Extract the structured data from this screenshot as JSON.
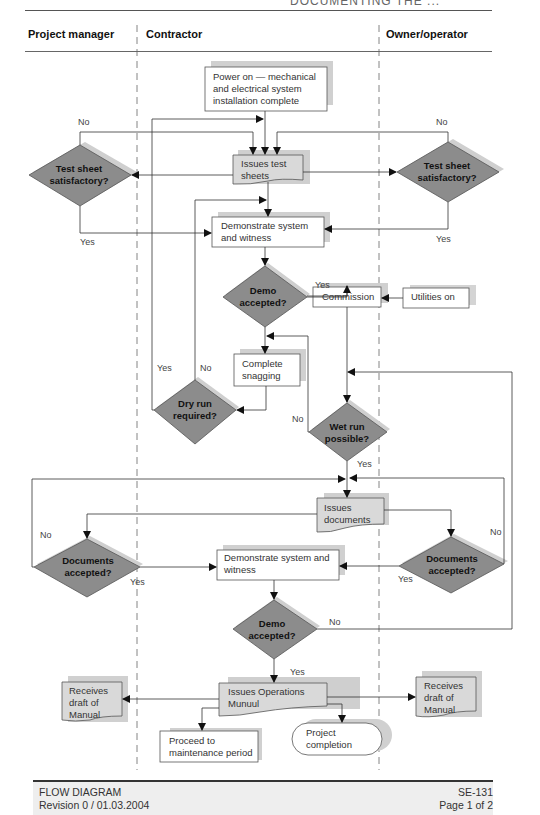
{
  "header": {
    "cropped_title": "DOCUMENTING THE ...",
    "lanes": [
      "Project manager",
      "Contractor",
      "Owner/operator"
    ]
  },
  "nodes": {
    "power_on": "Power on — mechanical and electrical system installation complete",
    "issues_test_sheets": "Issues test sheets",
    "demonstrate_1": "Demonstrate system and witness",
    "commission": "Commission",
    "utilities_on": "Utilities on",
    "complete_snagging": "Complete snagging",
    "issues_documents": "Issues documents",
    "demonstrate_2": "Demonstrate system and witness",
    "issues_operations_manual": "Issues Operations Munuul",
    "receives_draft_left": "Receives draft of Manual",
    "receives_draft_right": "Receives draft of Manual",
    "proceed_maintenance": "Proceed to maintenance period",
    "project_completion": "Project completion"
  },
  "decisions": {
    "test_sheet_pm": "Test sheet satisfactory?",
    "test_sheet_owner": "Test sheet satisfactory?",
    "demo_accepted_1": "Demo accepted?",
    "dry_run": "Dry run required?",
    "wet_run": "Wet run possible?",
    "documents_pm": "Documents accepted?",
    "documents_owner": "Documents accepted?",
    "demo_accepted_2": "Demo accepted?"
  },
  "labels": {
    "yes": "Yes",
    "no": "No"
  },
  "footer": {
    "title": "FLOW DIAGRAM",
    "revision": "Revision 0 / 01.03.2004",
    "doc_id": "SE-131",
    "page": "Page 1 of 2"
  },
  "colors": {
    "decision_fill": "#8c8c8c",
    "document_fill": "#d9d9d9",
    "shadow": "#cfcfcf",
    "line": "#333333"
  }
}
